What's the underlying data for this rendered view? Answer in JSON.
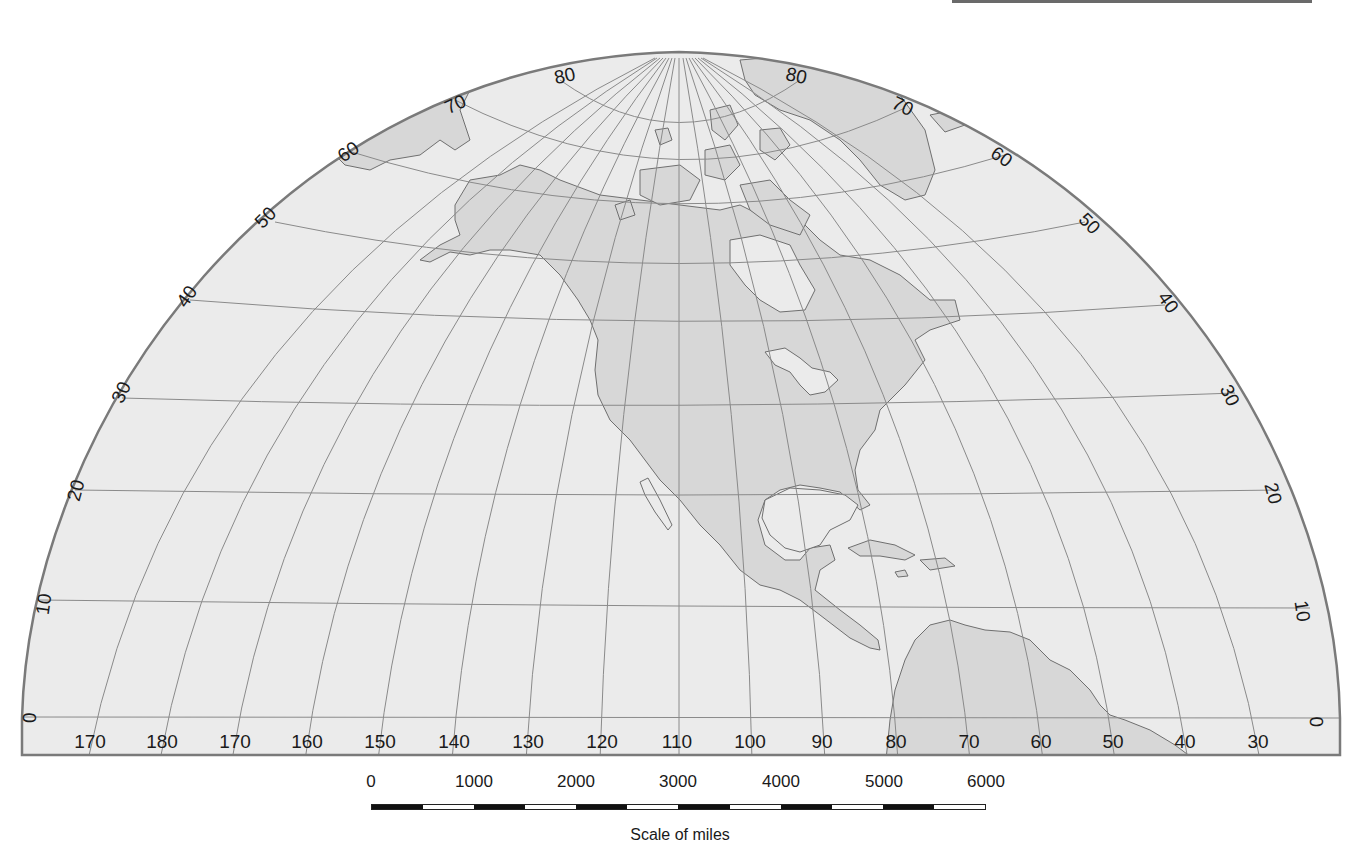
{
  "map": {
    "title": "North America outline map (graticule, polar-aspect projection)",
    "colors": {
      "ocean": "#ebebeb",
      "land": "#d7d7d7",
      "coast": "#6f6f6f",
      "graticule": "#8a8a8a",
      "border": "#7a7a7a",
      "label": "#1a1a1a"
    },
    "longitude_labels": [
      "170",
      "180",
      "170",
      "160",
      "150",
      "140",
      "130",
      "120",
      "110",
      "100",
      "90",
      "80",
      "70",
      "60",
      "50",
      "40",
      "30"
    ],
    "latitude_labels_left": [
      "0",
      "10",
      "20",
      "30",
      "40",
      "50",
      "60",
      "70",
      "80"
    ],
    "latitude_labels_right": [
      "80",
      "70",
      "60",
      "50",
      "40",
      "30",
      "20",
      "10",
      "0"
    ]
  },
  "scale": {
    "ticks": [
      "0",
      "1000",
      "2000",
      "3000",
      "4000",
      "5000",
      "6000"
    ],
    "title": "Scale of miles",
    "segments": 12
  }
}
